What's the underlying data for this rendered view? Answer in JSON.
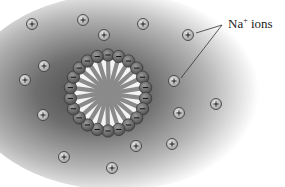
{
  "label": {
    "text": "Na",
    "sup": "+",
    "rest": " ions",
    "x": 228,
    "y": 16
  },
  "micelle": {
    "cx": 108,
    "cy": 93,
    "radius": 38,
    "head_radius": 6.2,
    "head_count": 22,
    "head_sign": "−"
  },
  "ions": [
    {
      "x": 32,
      "y": 24
    },
    {
      "x": 83,
      "y": 20
    },
    {
      "x": 143,
      "y": 24
    },
    {
      "x": 104,
      "y": 35
    },
    {
      "x": 188,
      "y": 35
    },
    {
      "x": 44,
      "y": 66
    },
    {
      "x": 25,
      "y": 80
    },
    {
      "x": 174,
      "y": 81
    },
    {
      "x": 216,
      "y": 104
    },
    {
      "x": 43,
      "y": 115
    },
    {
      "x": 179,
      "y": 113
    },
    {
      "x": 136,
      "y": 146
    },
    {
      "x": 172,
      "y": 144
    },
    {
      "x": 64,
      "y": 157
    },
    {
      "x": 112,
      "y": 168
    }
  ],
  "ion_sign": "+",
  "leader_lines": [
    {
      "from": {
        "x": 196,
        "y": 33
      },
      "to": {
        "x": 222,
        "y": 25
      }
    },
    {
      "from": {
        "x": 181,
        "y": 78
      },
      "to": {
        "x": 222,
        "y": 25
      }
    }
  ],
  "colors": {
    "cloud_center": "#5a5a5a",
    "cloud_edge": "#ffffff",
    "head_fill": "#6e6e6e",
    "tail": "#8a8a8a",
    "ion_fill": "#c8c8c8",
    "ion_stroke": "#333333"
  }
}
